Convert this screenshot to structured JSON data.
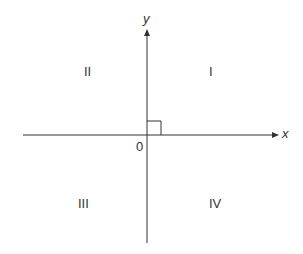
{
  "diagram": {
    "axes": {
      "x_label": "x",
      "y_label": "y",
      "origin_label": "0"
    },
    "quadrants": [
      {
        "id": "I",
        "label": "I"
      },
      {
        "id": "II",
        "label": "II"
      },
      {
        "id": "III",
        "label": "III"
      },
      {
        "id": "IV",
        "label": "IV"
      }
    ],
    "colors": {
      "line": "#333333",
      "background": "#ffffff"
    }
  }
}
